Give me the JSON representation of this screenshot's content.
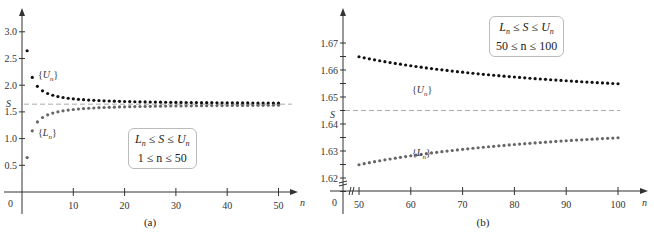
{
  "chart_data": [
    {
      "type": "scatter",
      "panel": "(a)",
      "xlabel": "n",
      "ylabel": "",
      "xlim": [
        0,
        52
      ],
      "ylim": [
        0,
        3.3
      ],
      "x_ticks": [
        10,
        20,
        30,
        40,
        50
      ],
      "y_ticks": [
        0.5,
        1.0,
        1.5,
        2.0,
        2.5,
        3.0
      ],
      "x_tick_labels": [
        "10",
        "20",
        "30",
        "40",
        "50"
      ],
      "y_tick_labels": [
        "0.5",
        "1.0",
        "1.5",
        "2.0",
        "2.5",
        "3.0"
      ],
      "origin_label": "0",
      "reference_line": {
        "label": "S",
        "y": 1.645,
        "style": "dashed"
      },
      "series": [
        {
          "name": "{U_n}",
          "label": "{U",
          "sub": "n",
          "x_range": [
            1,
            50
          ],
          "formula": "S + 1/n",
          "color": "#111111"
        },
        {
          "name": "{L_n}",
          "label": "{L",
          "sub": "n",
          "x_range": [
            1,
            50
          ],
          "formula": "S - 1/n",
          "color": "#666666"
        }
      ],
      "annotation": {
        "line1": "L_n ≤ S ≤ U_n",
        "line2": "1 ≤ n ≤ 50"
      },
      "grid": false
    },
    {
      "type": "scatter",
      "panel": "(b)",
      "xlabel": "n",
      "ylabel": "",
      "xlim": [
        45,
        103
      ],
      "ylim": [
        1.615,
        1.68
      ],
      "x_ticks": [
        50,
        60,
        70,
        80,
        90,
        100
      ],
      "y_ticks": [
        1.62,
        1.63,
        1.64,
        1.65,
        1.66,
        1.67
      ],
      "x_tick_labels": [
        "50",
        "60",
        "70",
        "80",
        "90",
        "100"
      ],
      "y_tick_labels": [
        "1.62",
        "1.63",
        "1.64",
        "1.65",
        "1.66",
        "1.67"
      ],
      "origin_label": "0",
      "axis_breaks": true,
      "reference_line": {
        "label": "S",
        "y": 1.645,
        "style": "dashed"
      },
      "series": [
        {
          "name": "{U_n}",
          "label": "{U",
          "sub": "n",
          "x_range": [
            50,
            100
          ],
          "formula": "S + 1/n",
          "color": "#111111"
        },
        {
          "name": "{L_n}",
          "label": "{L",
          "sub": "n",
          "x_range": [
            50,
            100
          ],
          "formula": "S - 1/n",
          "color": "#666666"
        }
      ],
      "annotation": {
        "line1": "L_n ≤ S ≤ U_n",
        "line2": "50 ≤ n ≤ 100"
      },
      "grid": false
    }
  ],
  "left": {
    "caption": "(a)",
    "box_line2": "1 ≤ n ≤ 50"
  },
  "right": {
    "caption": "(b)",
    "box_line2": "50 ≤ n ≤ 100"
  },
  "S_value": 1.6449
}
